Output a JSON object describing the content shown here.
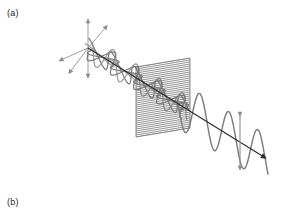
{
  "figure": {
    "width": 285,
    "height": 213,
    "background_color": "#ffffff",
    "caption_labels": [
      {
        "id": "a",
        "text": "(a)",
        "x": 7,
        "y": 9
      },
      {
        "id": "b",
        "text": "(b)",
        "x": 7,
        "y": 198
      }
    ]
  },
  "colors": {
    "ray": "#2b2b2b",
    "wave": "#7d7d7d",
    "wave_secondary": "#9a9a9a",
    "axis": "#8c8c8c",
    "polarizer_line": "#6e6e6e",
    "polarizer_edge": "#6e6e6e",
    "polarization_arrow": "#8c8c8c",
    "text": "#231f20",
    "background": "#ffffff"
  },
  "geometry": {
    "ray": {
      "start": {
        "x": 88,
        "y": 48
      },
      "end": {
        "x": 268,
        "y": 160
      },
      "arrowhead": {
        "x": 268,
        "y": 160,
        "size": 3.4
      }
    },
    "axes_origin": {
      "x": 88,
      "y": 48
    },
    "axes_arrows": [
      {
        "name": "axis-up",
        "to": {
          "x": 88,
          "y": 21
        }
      },
      {
        "name": "axis-down",
        "to": {
          "x": 88,
          "y": 76
        }
      },
      {
        "name": "axis-left",
        "to": {
          "x": 61,
          "y": 60
        }
      },
      {
        "name": "axis-upper-right",
        "to": {
          "x": 106,
          "y": 27
        }
      },
      {
        "name": "axis-lower-left",
        "to": {
          "x": 70,
          "y": 72
        }
      }
    ],
    "polarizer": {
      "top_left": {
        "x": 136,
        "y": 67
      },
      "top_right": {
        "x": 190,
        "y": 58
      },
      "bottom_right": {
        "x": 190,
        "y": 128
      },
      "bottom_left": {
        "x": 136,
        "y": 137
      },
      "line_count": 35
    },
    "polarization_arrow": {
      "x": 240,
      "top": {
        "x": 240,
        "y": 112
      },
      "bottom": {
        "x": 240,
        "y": 170
      },
      "double_headed": true
    },
    "unpolarized_section": {
      "t_start": 0.02,
      "t_end": 0.56,
      "cycles": 4.2,
      "amplitude": 13,
      "plane_angles_deg": [
        0,
        36,
        72,
        108,
        144
      ]
    },
    "polarized_section": {
      "t_start": 0.5,
      "t_end": 1.0,
      "cycles": 3.1,
      "amplitude": 24,
      "plane_angle_deg": 90
    }
  },
  "chart_data": {
    "type": "diagram",
    "elements": [
      {
        "name": "coordinate-axes",
        "label": "3D axis triad at source"
      },
      {
        "name": "unpolarized-wave",
        "label": "Unpolarized light (multiple planes of vibration)"
      },
      {
        "name": "polarizer-sheet",
        "label": "Linear polarizer with transmission grid"
      },
      {
        "name": "polarized-wave",
        "label": "Linearly polarized light (single plane)"
      },
      {
        "name": "polarization-arrow",
        "label": "Plane of polarization (vertical)"
      },
      {
        "name": "propagation-ray",
        "label": "Direction of propagation"
      }
    ],
    "legend": [],
    "grid": false
  }
}
